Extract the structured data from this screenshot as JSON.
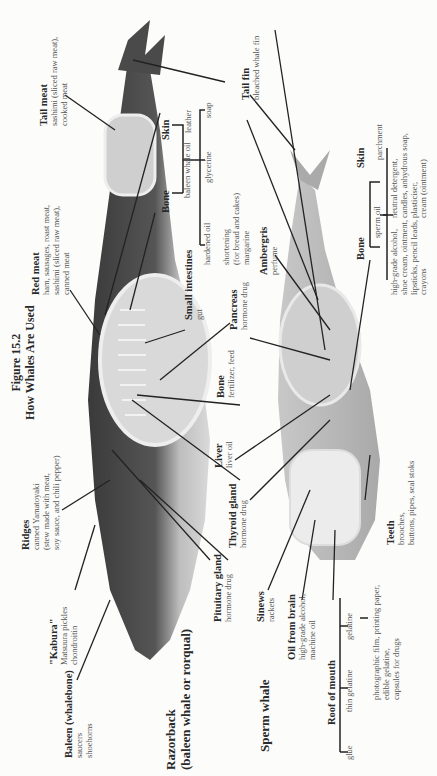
{
  "figure": {
    "number": "Figure 15.2",
    "title": "How Whales Are Used"
  },
  "species": {
    "razorback": {
      "name": "Razorback",
      "subtitle": "(baleen whale or rorqual)"
    },
    "sperm": {
      "name": "Sperm whale"
    }
  },
  "razorback_labels": [
    {
      "part": "Tail meat",
      "uses": [
        "sashimi (sliced raw meat),",
        "cooked meat"
      ]
    },
    {
      "part": "Red meat",
      "uses": [
        "ham, sausages, roast meat,",
        "sashimi (sliced raw meat),",
        "canned meat"
      ]
    },
    {
      "part": "Small intestines",
      "uses": [
        "gut"
      ]
    },
    {
      "part": "Ridges",
      "uses": [
        "canned Yamatoyaki",
        "(stew made with meat,",
        "soy sauce, and chili pepper)"
      ]
    },
    {
      "part": "\"Kabura\"",
      "uses": [
        "Matsuura pickles",
        "chondroitin"
      ]
    },
    {
      "part": "Baleen (whalebone)",
      "uses": [
        "saucers",
        "shoehorns"
      ]
    },
    {
      "part": "Pituitary gland",
      "uses": [
        "hormone drug"
      ]
    },
    {
      "part": "Thyroid gland",
      "uses": [
        "hormone drug"
      ]
    },
    {
      "part": "Liver",
      "uses": [
        "liver oil"
      ]
    },
    {
      "part": "Bone",
      "uses": [
        "fertilizer, feed"
      ]
    },
    {
      "part": "Pancreas",
      "uses": [
        "hormone drug"
      ]
    }
  ],
  "razorback_tree": {
    "skin": "Skin",
    "bone": "Bone",
    "baleen_oil": "baleen whale oil",
    "leather": "leather",
    "soap": "soap",
    "glycerine": "glycerine",
    "hardened_oil": "hardened oil",
    "shortening": [
      "shortening",
      "(for bread and cakes)",
      "margarine"
    ]
  },
  "shared_labels": {
    "tail_fin": {
      "part": "Tail fin",
      "uses": [
        "bleached whale fin"
      ]
    }
  },
  "sperm_labels": [
    {
      "part": "Ambergris",
      "uses": [
        "perfume"
      ]
    },
    {
      "part": "Sinews",
      "uses": [
        "rackets"
      ]
    },
    {
      "part": "Oil from brain",
      "uses": [
        "high-grade alcohol,",
        "machine oil"
      ]
    },
    {
      "part": "Teeth",
      "uses": [
        "brooches,",
        "buttons, pipes, seal stoks"
      ]
    }
  ],
  "sperm_tree": {
    "skin": "Skin",
    "parchment": "parchment",
    "bone": "Bone",
    "sperm_oil": "sperm oil",
    "oil_uses_a": [
      "high-grade alcohol,",
      "shoe cream, ointment,",
      "lipsticks, pencil leads,",
      "crayons"
    ],
    "oil_uses_b": [
      "neutral detergent,",
      "candles, anhydrous soap,",
      "plasticiser,",
      "cream (ointment)"
    ]
  },
  "roof_tree": {
    "root": "Roof of mouth",
    "glue": "glue",
    "thin_gelatine": "thin gelatine",
    "gelatine": "gelatine",
    "gelatine_uses": [
      "photographic film, printing paper,",
      "edible gelatine,",
      "capsules for drugs"
    ]
  }
}
